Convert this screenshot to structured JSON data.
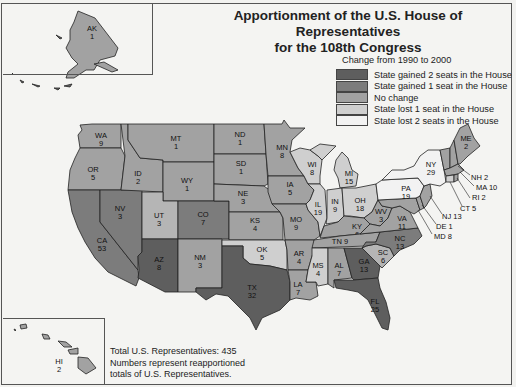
{
  "title_line1": "Apportionment of the U.S. House of Representatives",
  "title_line2": "for the 108th Congress",
  "legend": {
    "title": "Change from 1990 to 2000",
    "items": [
      {
        "label": "State gained 2 seats in the House",
        "color": "#5e5e5e"
      },
      {
        "label": "State gained 1 seat in the House",
        "color": "#7c7c7c"
      },
      {
        "label": "No change",
        "color": "#a2a2a2"
      },
      {
        "label": "State lost 1 seat in the House",
        "color": "#cfcfcf"
      },
      {
        "label": "State lost 2 seats in the House",
        "color": "#f2f2f2"
      }
    ]
  },
  "notes": {
    "total": "Total U.S. Representatives: 435",
    "line2": "Numbers represent reapportioned",
    "line3": "totals of U.S. Representatives."
  },
  "states": {
    "AK": {
      "abbr": "AK",
      "seats": "1",
      "change": "no-change"
    },
    "HI": {
      "abbr": "HI",
      "seats": "2",
      "change": "no-change"
    },
    "WA": {
      "abbr": "WA",
      "seats": "9",
      "change": "no-change"
    },
    "OR": {
      "abbr": "OR",
      "seats": "5",
      "change": "no-change"
    },
    "CA": {
      "abbr": "CA",
      "seats": "53",
      "change": "gained-1"
    },
    "NV": {
      "abbr": "NV",
      "seats": "3",
      "change": "gained-1"
    },
    "ID": {
      "abbr": "ID",
      "seats": "2",
      "change": "no-change"
    },
    "MT": {
      "abbr": "MT",
      "seats": "1",
      "change": "no-change"
    },
    "WY": {
      "abbr": "WY",
      "seats": "1",
      "change": "no-change"
    },
    "UT": {
      "abbr": "UT",
      "seats": "3",
      "change": "no-change"
    },
    "AZ": {
      "abbr": "AZ",
      "seats": "8",
      "change": "gained-2"
    },
    "CO": {
      "abbr": "CO",
      "seats": "7",
      "change": "gained-1"
    },
    "NM": {
      "abbr": "NM",
      "seats": "3",
      "change": "no-change"
    },
    "ND": {
      "abbr": "ND",
      "seats": "1",
      "change": "no-change"
    },
    "SD": {
      "abbr": "SD",
      "seats": "1",
      "change": "no-change"
    },
    "NE": {
      "abbr": "NE",
      "seats": "3",
      "change": "no-change"
    },
    "KS": {
      "abbr": "KS",
      "seats": "4",
      "change": "no-change"
    },
    "OK": {
      "abbr": "OK",
      "seats": "5",
      "change": "lost-1"
    },
    "TX": {
      "abbr": "TX",
      "seats": "32",
      "change": "gained-2"
    },
    "MN": {
      "abbr": "MN",
      "seats": "8",
      "change": "no-change"
    },
    "IA": {
      "abbr": "IA",
      "seats": "5",
      "change": "no-change"
    },
    "MO": {
      "abbr": "MO",
      "seats": "9",
      "change": "no-change"
    },
    "AR": {
      "abbr": "AR",
      "seats": "4",
      "change": "no-change"
    },
    "LA": {
      "abbr": "LA",
      "seats": "7",
      "change": "no-change"
    },
    "WI": {
      "abbr": "WI",
      "seats": "8",
      "change": "lost-1"
    },
    "IL": {
      "abbr": "IL",
      "seats": "19",
      "change": "lost-1"
    },
    "MS": {
      "abbr": "MS",
      "seats": "4",
      "change": "lost-1"
    },
    "MI": {
      "abbr": "MI",
      "seats": "15",
      "change": "lost-1"
    },
    "IN": {
      "abbr": "IN",
      "seats": "9",
      "change": "lost-1"
    },
    "OH": {
      "abbr": "OH",
      "seats": "18",
      "change": "lost-1"
    },
    "KY": {
      "abbr": "KY",
      "seats": "6",
      "change": "no-change"
    },
    "TN": {
      "abbr": "TN",
      "seats": "9",
      "change": "no-change"
    },
    "AL": {
      "abbr": "AL",
      "seats": "7",
      "change": "no-change"
    },
    "GA": {
      "abbr": "GA",
      "seats": "13",
      "change": "gained-2"
    },
    "FL": {
      "abbr": "FL",
      "seats": "25",
      "change": "gained-2"
    },
    "SC": {
      "abbr": "SC",
      "seats": "6",
      "change": "no-change"
    },
    "NC": {
      "abbr": "NC",
      "seats": "13",
      "change": "gained-1"
    },
    "VA": {
      "abbr": "VA",
      "seats": "11",
      "change": "no-change"
    },
    "WV": {
      "abbr": "WV",
      "seats": "3",
      "change": "no-change"
    },
    "PA": {
      "abbr": "PA",
      "seats": "19",
      "change": "lost-2"
    },
    "NY": {
      "abbr": "NY",
      "seats": "29",
      "change": "lost-2"
    },
    "VT": {
      "abbr": "VT",
      "seats": "1",
      "change": "no-change"
    },
    "NH": {
      "abbr": "NH",
      "seats": "2",
      "change": "no-change"
    },
    "ME": {
      "abbr": "ME",
      "seats": "2",
      "change": "no-change"
    },
    "MA": {
      "abbr": "MA",
      "seats": "10",
      "change": "no-change"
    },
    "RI": {
      "abbr": "RI",
      "seats": "2",
      "change": "no-change"
    },
    "CT": {
      "abbr": "CT",
      "seats": "5",
      "change": "lost-1"
    },
    "NJ": {
      "abbr": "NJ",
      "seats": "13",
      "change": "no-change"
    },
    "DE": {
      "abbr": "DE",
      "seats": "1",
      "change": "no-change"
    },
    "MD": {
      "abbr": "MD",
      "seats": "8",
      "change": "no-change"
    }
  },
  "callouts": {
    "NH": "NH 2",
    "MA": "MA 10",
    "RI": "RI 2",
    "CT": "CT 5",
    "NJ": "NJ 13",
    "DE": "DE 1",
    "MD": "MD 8",
    "TN": "TN 9"
  }
}
